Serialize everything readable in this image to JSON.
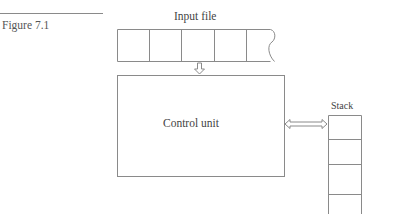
{
  "figure": {
    "label": "Figure 7.1"
  },
  "diagram": {
    "input_file": {
      "label": "Input file",
      "cells": 5,
      "right_end": "wavy-break"
    },
    "control_unit": {
      "label": "Control unit"
    },
    "stack": {
      "label": "Stack",
      "cells": 4,
      "bottom": "open"
    },
    "connections": [
      {
        "from": "input_file",
        "to": "control_unit",
        "type": "hollow-arrow-down"
      },
      {
        "from": "control_unit",
        "to": "stack",
        "type": "hollow-double-arrow"
      }
    ],
    "line_color": "#8a8a8a"
  }
}
